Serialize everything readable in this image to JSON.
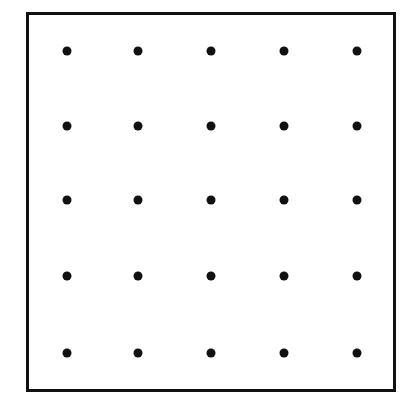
{
  "diagram": {
    "type": "dot-grid",
    "rows": 5,
    "cols": 5,
    "frame": {
      "x": 26,
      "y": 12,
      "width": 370,
      "height": 380,
      "stroke": "#111111"
    },
    "dot_color": "#111111",
    "dot_diameter": 9,
    "col_x": [
      67,
      138,
      211,
      284,
      357
    ],
    "row_y": [
      51,
      126,
      200,
      276,
      353
    ]
  }
}
